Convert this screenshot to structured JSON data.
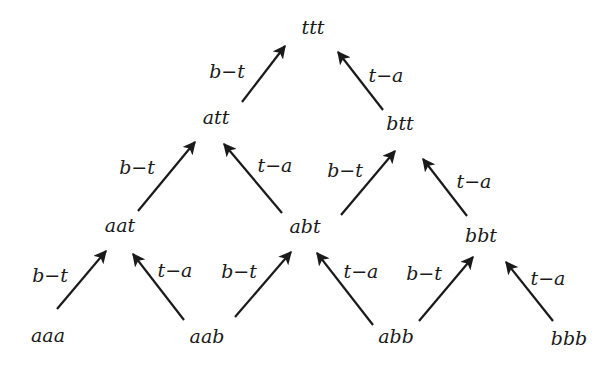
{
  "diagram": {
    "type": "lattice",
    "colors": {
      "ink": "#1a1a1a",
      "background": "#ffffff"
    },
    "nodes": [
      {
        "id": "ttt",
        "label": "ttt",
        "x": 313,
        "y": 34
      },
      {
        "id": "att",
        "label": "att",
        "x": 216,
        "y": 124
      },
      {
        "id": "btt",
        "label": "btt",
        "x": 400,
        "y": 130
      },
      {
        "id": "aat",
        "label": "aat",
        "x": 120,
        "y": 232
      },
      {
        "id": "abt",
        "label": "abt",
        "x": 305,
        "y": 233
      },
      {
        "id": "bbt",
        "label": "bbt",
        "x": 481,
        "y": 242
      },
      {
        "id": "aaa",
        "label": "aaa",
        "x": 48,
        "y": 342
      },
      {
        "id": "aab",
        "label": "aab",
        "x": 207,
        "y": 343
      },
      {
        "id": "abb",
        "label": "abb",
        "x": 396,
        "y": 343
      },
      {
        "id": "bbb",
        "label": "bbb",
        "x": 569,
        "y": 345
      }
    ],
    "edges": [
      {
        "from": "att",
        "to": "ttt",
        "label": "b−t",
        "x1": 242,
        "y1": 102,
        "x2": 285,
        "y2": 46,
        "lx": 227,
        "ly": 78
      },
      {
        "from": "btt",
        "to": "ttt",
        "label": "t−a",
        "x1": 383,
        "y1": 110,
        "x2": 338,
        "y2": 52,
        "lx": 386,
        "ly": 82
      },
      {
        "from": "aat",
        "to": "att",
        "label": "b−t",
        "x1": 138,
        "y1": 211,
        "x2": 195,
        "y2": 142,
        "lx": 137,
        "ly": 174
      },
      {
        "from": "abt",
        "to": "att",
        "label": "t−a",
        "x1": 282,
        "y1": 213,
        "x2": 224,
        "y2": 144,
        "lx": 275,
        "ly": 172
      },
      {
        "from": "abt",
        "to": "btt",
        "label": "b−t",
        "x1": 341,
        "y1": 215,
        "x2": 395,
        "y2": 151,
        "lx": 345,
        "ly": 177
      },
      {
        "from": "bbt",
        "to": "btt",
        "label": "t−a",
        "x1": 467,
        "y1": 216,
        "x2": 423,
        "y2": 159,
        "lx": 474,
        "ly": 188
      },
      {
        "from": "aaa",
        "to": "aat",
        "label": "b−t",
        "x1": 57,
        "y1": 309,
        "x2": 106,
        "y2": 251,
        "lx": 50,
        "ly": 282
      },
      {
        "from": "aab",
        "to": "aat",
        "label": "t−a",
        "x1": 184,
        "y1": 320,
        "x2": 133,
        "y2": 254,
        "lx": 175,
        "ly": 277
      },
      {
        "from": "aab",
        "to": "abt",
        "label": "b−t",
        "x1": 235,
        "y1": 317,
        "x2": 291,
        "y2": 252,
        "lx": 239,
        "ly": 278
      },
      {
        "from": "abb",
        "to": "abt",
        "label": "t−a",
        "x1": 373,
        "y1": 325,
        "x2": 317,
        "y2": 253,
        "lx": 361,
        "ly": 278
      },
      {
        "from": "abb",
        "to": "bbt",
        "label": "b−t",
        "x1": 419,
        "y1": 321,
        "x2": 473,
        "y2": 257,
        "lx": 424,
        "ly": 280
      },
      {
        "from": "bbb",
        "to": "bbt",
        "label": "t−a",
        "x1": 553,
        "y1": 321,
        "x2": 506,
        "y2": 262,
        "lx": 548,
        "ly": 285
      }
    ]
  }
}
